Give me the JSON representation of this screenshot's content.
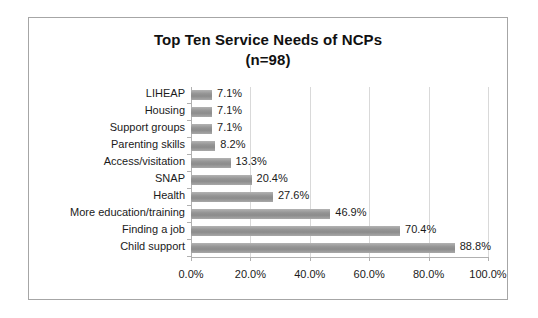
{
  "chart_data": {
    "type": "bar",
    "orientation": "horizontal",
    "title": "Top Ten Service Needs of NCPs",
    "subtitle": "(n=98)",
    "xlabel": "",
    "ylabel": "",
    "xlim": [
      0,
      100
    ],
    "xticks": [
      "0.0%",
      "20.0%",
      "40.0%",
      "60.0%",
      "80.0%",
      "100.0%"
    ],
    "xtick_values": [
      0,
      20,
      40,
      60,
      80,
      100
    ],
    "grid": "vertical",
    "legend": "none",
    "bar_color": "#969696",
    "categories": [
      "LIHEAP",
      "Housing",
      "Support groups",
      "Parenting skills",
      "Access/visitation",
      "SNAP",
      "Health",
      "More education/training",
      "Finding a job",
      "Child support"
    ],
    "values": [
      7.1,
      7.1,
      7.1,
      8.2,
      13.3,
      20.4,
      27.6,
      46.9,
      70.4,
      88.8
    ],
    "data_labels": [
      "7.1%",
      "7.1%",
      "7.1%",
      "8.2%",
      "13.3%",
      "20.4%",
      "27.6%",
      "46.9%",
      "70.4%",
      "88.8%"
    ]
  }
}
